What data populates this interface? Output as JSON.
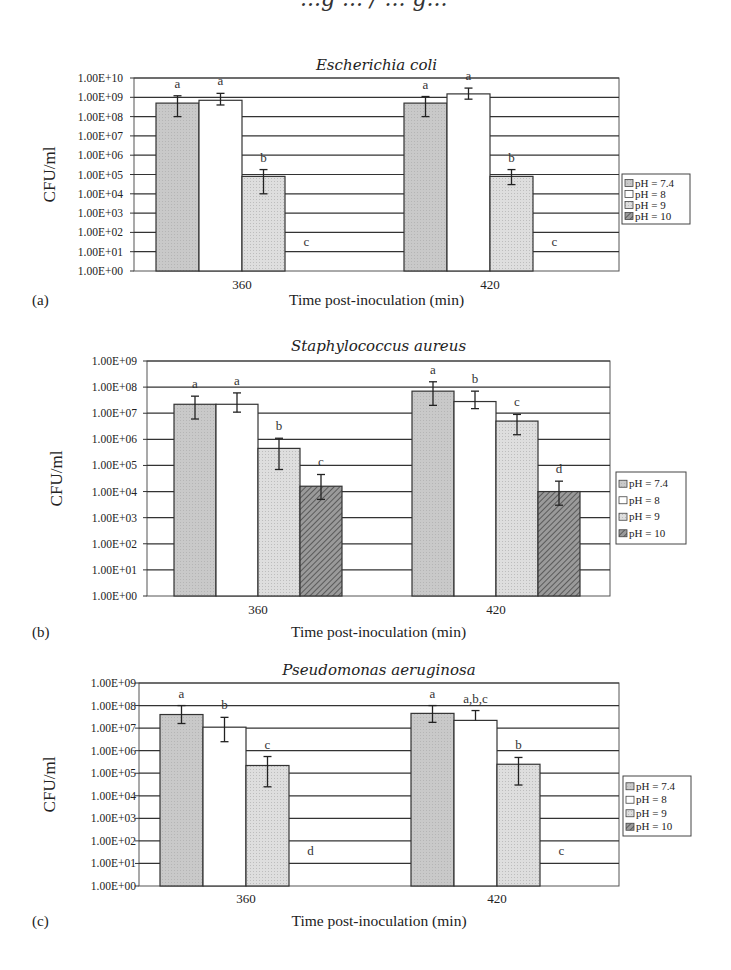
{
  "page": {
    "header_fragment": "...g ... / ... g..."
  },
  "legend_labels": [
    "pH = 7.4",
    "pH = 8",
    "pH = 9",
    "pH = 10"
  ],
  "colors": {
    "pH_7_4": "#c8c8c8",
    "pH_8": "#ffffff",
    "pH_9": "#d9d9d9",
    "pH_10": "#8a8a8a",
    "grid": "#333333"
  },
  "chart_data": [
    {
      "type": "bar",
      "panel": "(a)",
      "title": "Escherichia coli",
      "xlabel": "Time post-inoculation (min)",
      "ylabel": "CFU/ml",
      "yscale": "log",
      "ylim": [
        1,
        10000000000.0
      ],
      "yticks": [
        "1.00E+00",
        "1.00E+01",
        "1.00E+02",
        "1.00E+03",
        "1.00E+04",
        "1.00E+05",
        "1.00E+06",
        "1.00E+07",
        "1.00E+08",
        "1.00E+09",
        "1.00E+10"
      ],
      "categories": [
        "360",
        "420"
      ],
      "legend": "right",
      "series": [
        {
          "name": "pH = 7.4",
          "values": [
            500000000.0,
            500000000.0
          ],
          "err_low": [
            100000000.0,
            100000000.0
          ],
          "err_high": [
            1200000000.0,
            1100000000.0
          ],
          "letters": [
            "a",
            "a"
          ]
        },
        {
          "name": "pH = 8",
          "values": [
            700000000.0,
            1500000000.0
          ],
          "err_low": [
            400000000.0,
            800000000.0
          ],
          "err_high": [
            1600000000.0,
            3000000000.0
          ],
          "letters": [
            "a",
            "a"
          ]
        },
        {
          "name": "pH = 9",
          "values": [
            80000.0,
            80000.0
          ],
          "err_low": [
            10000.0,
            30000.0
          ],
          "err_high": [
            180000.0,
            180000.0
          ],
          "letters": [
            "b",
            "b"
          ]
        },
        {
          "name": "pH = 10",
          "values": [
            0,
            0
          ],
          "err_low": [
            null,
            null
          ],
          "err_high": [
            null,
            null
          ],
          "letters": [
            "c",
            "c"
          ]
        }
      ]
    },
    {
      "type": "bar",
      "panel": "(b)",
      "title": "Staphylococcus aureus",
      "xlabel": "Time post-inoculation (min)",
      "ylabel": "CFU/ml",
      "yscale": "log",
      "ylim": [
        1,
        1000000000.0
      ],
      "yticks": [
        "1.00E+00",
        "1.00E+01",
        "1.00E+02",
        "1.00E+03",
        "1.00E+04",
        "1.00E+05",
        "1.00E+06",
        "1.00E+07",
        "1.00E+08",
        "1.00E+09"
      ],
      "categories": [
        "360",
        "420"
      ],
      "legend": "right",
      "series": [
        {
          "name": "pH = 7.4",
          "values": [
            22000000.0,
            70000000.0
          ],
          "err_low": [
            6000000.0,
            20000000.0
          ],
          "err_high": [
            45000000.0,
            160000000.0
          ],
          "letters": [
            "a",
            "a"
          ]
        },
        {
          "name": "pH = 8",
          "values": [
            22000000.0,
            28000000.0
          ],
          "err_low": [
            11000000.0,
            15000000.0
          ],
          "err_high": [
            60000000.0,
            70000000.0
          ],
          "letters": [
            "a",
            "b"
          ]
        },
        {
          "name": "pH = 9",
          "values": [
            450000.0,
            5000000.0
          ],
          "err_low": [
            70000.0,
            1500000.0
          ],
          "err_high": [
            1100000.0,
            9000000.0
          ],
          "letters": [
            "b",
            "c"
          ]
        },
        {
          "name": "pH = 10",
          "values": [
            16000.0,
            10000.0
          ],
          "err_low": [
            5000.0,
            3000.0
          ],
          "err_high": [
            45000.0,
            25000.0
          ],
          "letters": [
            "c",
            "d"
          ]
        }
      ]
    },
    {
      "type": "bar",
      "panel": "(c)",
      "title": "Pseudomonas aeruginosa",
      "xlabel": "Time post-inoculation (min)",
      "ylabel": "CFU/ml",
      "yscale": "log",
      "ylim": [
        1,
        1000000000.0
      ],
      "yticks": [
        "1.00E+00",
        "1.00E+01",
        "1.00E+02",
        "1.00E+03",
        "1.00E+04",
        "1.00E+05",
        "1.00E+06",
        "1.00E+07",
        "1.00E+08",
        "1.00E+09"
      ],
      "categories": [
        "360",
        "420"
      ],
      "legend": "right",
      "series": [
        {
          "name": "pH = 7.4",
          "values": [
            40000000.0,
            45000000.0
          ],
          "err_low": [
            16000000.0,
            18000000.0
          ],
          "err_high": [
            100000000.0,
            100000000.0
          ],
          "letters": [
            "a",
            "a"
          ]
        },
        {
          "name": "pH = 8",
          "values": [
            11000000.0,
            22000000.0
          ],
          "err_low": [
            2500000.0,
            null
          ],
          "err_high": [
            30000000.0,
            60000000.0
          ],
          "letters": [
            "b",
            "a,b,c"
          ]
        },
        {
          "name": "pH = 9",
          "values": [
            220000.0,
            250000.0
          ],
          "err_low": [
            25000.0,
            30000.0
          ],
          "err_high": [
            550000.0,
            500000.0
          ],
          "letters": [
            "c",
            "b"
          ]
        },
        {
          "name": "pH = 10",
          "values": [
            0,
            0
          ],
          "err_low": [
            null,
            null
          ],
          "err_high": [
            null,
            null
          ],
          "letters": [
            "d",
            "c"
          ]
        }
      ]
    }
  ]
}
